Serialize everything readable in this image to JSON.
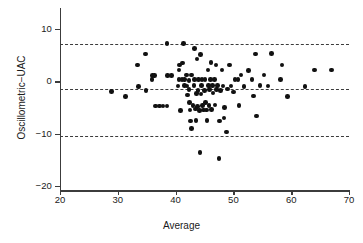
{
  "chart_data": {
    "type": "scatter",
    "title": "",
    "xlabel": "Average",
    "ylabel": "Oscillometric−UAC",
    "xlim": [
      20,
      70
    ],
    "ylim": [
      -20,
      13
    ],
    "xticks": [
      20,
      30,
      40,
      50,
      60,
      70
    ],
    "yticks": [
      10,
      0,
      -10,
      -20
    ],
    "xtick_labels": [
      "20",
      "30",
      "40",
      "50",
      "60",
      "70"
    ],
    "ytick_labels": [
      "10",
      "0",
      "−10",
      "−20"
    ],
    "grid": false,
    "legend": null,
    "reference_lines": [
      {
        "name": "upper-limit-of-agreement",
        "y": 7.2,
        "style": "dashed"
      },
      {
        "name": "mean-bias",
        "y": -1.5,
        "style": "dashed"
      },
      {
        "name": "lower-limit-of-agreement",
        "y": -10.4,
        "style": "dashed"
      }
    ],
    "marker": {
      "shape": "circle",
      "color": "#111111",
      "size": 4.6
    },
    "n_points": 104,
    "points": [
      [
        28.9,
        -1.9
      ],
      [
        31.3,
        -2.9
      ],
      [
        33.4,
        3.1
      ],
      [
        33.6,
        -1.0
      ],
      [
        34.8,
        5.2
      ],
      [
        34.9,
        -1.8
      ],
      [
        35.9,
        0.3
      ],
      [
        36.0,
        1.1
      ],
      [
        36.4,
        1.1
      ],
      [
        36.5,
        -4.7
      ],
      [
        37.2,
        -4.7
      ],
      [
        37.8,
        -4.7
      ],
      [
        38.5,
        -4.7
      ],
      [
        38.5,
        7.2
      ],
      [
        38.6,
        1.1
      ],
      [
        39.3,
        1.1
      ],
      [
        40.4,
        -0.9
      ],
      [
        40.6,
        0.3
      ],
      [
        40.6,
        2.2
      ],
      [
        40.7,
        3.1
      ],
      [
        40.8,
        -5.6
      ],
      [
        41.1,
        0.3
      ],
      [
        41.2,
        3.5
      ],
      [
        41.4,
        7.2
      ],
      [
        41.5,
        0.3
      ],
      [
        41.5,
        -0.8
      ],
      [
        41.9,
        1.2
      ],
      [
        42.0,
        -0.9
      ],
      [
        42.1,
        -2.6
      ],
      [
        42.3,
        0.2
      ],
      [
        42.3,
        -1.6
      ],
      [
        42.4,
        -4.1
      ],
      [
        42.5,
        -5.5
      ],
      [
        42.6,
        -7.6
      ],
      [
        42.7,
        -9.0
      ],
      [
        42.8,
        1.2
      ],
      [
        43.0,
        -4.6
      ],
      [
        43.2,
        -0.8
      ],
      [
        43.3,
        6.3
      ],
      [
        43.3,
        0.3
      ],
      [
        43.4,
        -5.3
      ],
      [
        43.5,
        -7.5
      ],
      [
        43.6,
        -2.3
      ],
      [
        43.7,
        4.3
      ],
      [
        43.8,
        -4.8
      ],
      [
        43.9,
        -1.7
      ],
      [
        44.0,
        0.3
      ],
      [
        44.1,
        -5.6
      ],
      [
        44.2,
        -13.6
      ],
      [
        44.3,
        5.1
      ],
      [
        44.4,
        -2.4
      ],
      [
        44.5,
        -0.8
      ],
      [
        44.6,
        0.3
      ],
      [
        44.7,
        -4.6
      ],
      [
        44.8,
        -5.5
      ],
      [
        45.0,
        -1.7
      ],
      [
        45.1,
        0.3
      ],
      [
        45.2,
        -4.0
      ],
      [
        45.3,
        -5.5
      ],
      [
        45.4,
        -7.5
      ],
      [
        45.6,
        2.2
      ],
      [
        45.7,
        -0.8
      ],
      [
        45.8,
        -4.6
      ],
      [
        45.9,
        -1.6
      ],
      [
        46.0,
        0.3
      ],
      [
        46.1,
        3.6
      ],
      [
        46.2,
        -5.4
      ],
      [
        46.4,
        -0.8
      ],
      [
        46.5,
        -2.2
      ],
      [
        46.7,
        0.3
      ],
      [
        46.8,
        -4.5
      ],
      [
        47.0,
        3.1
      ],
      [
        47.1,
        -1.6
      ],
      [
        47.3,
        -0.8
      ],
      [
        47.5,
        -14.7
      ],
      [
        47.6,
        -7.6
      ],
      [
        47.8,
        -1.7
      ],
      [
        48.0,
        2.2
      ],
      [
        48.2,
        -0.9
      ],
      [
        48.4,
        -7.0
      ],
      [
        48.5,
        -5.0
      ],
      [
        48.8,
        -9.7
      ],
      [
        49.0,
        -1.5
      ],
      [
        49.3,
        3.1
      ],
      [
        49.6,
        -0.9
      ],
      [
        50.0,
        -2.0
      ],
      [
        50.3,
        0.3
      ],
      [
        50.8,
        0.3
      ],
      [
        51.0,
        -4.6
      ],
      [
        51.3,
        1.2
      ],
      [
        51.8,
        -1.0
      ],
      [
        52.6,
        2.1
      ],
      [
        53.2,
        0.3
      ],
      [
        53.5,
        -2.8
      ],
      [
        53.8,
        5.2
      ],
      [
        54.0,
        -6.6
      ],
      [
        54.6,
        -0.8
      ],
      [
        55.3,
        1.2
      ],
      [
        56.0,
        -0.9
      ],
      [
        56.6,
        5.3
      ],
      [
        58.1,
        0.3
      ],
      [
        58.4,
        3.1
      ],
      [
        59.4,
        -2.9
      ],
      [
        62.4,
        -1.0
      ],
      [
        64.0,
        2.2
      ],
      [
        67.0,
        2.2
      ]
    ]
  },
  "figure": {
    "background": "#ffffff",
    "axis_color": "#3c3c3c",
    "text_color": "#1a1a1a"
  }
}
